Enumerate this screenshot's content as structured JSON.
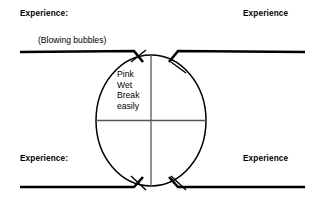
{
  "diagram": {
    "type": "venn-style-quadrant-circle",
    "labels": {
      "top_left": "Experience:",
      "top_right": "Experience",
      "bottom_left": "Experience:",
      "bottom_right": "Experience",
      "annotation_top_left": "(Blowing bubbles)"
    },
    "center_lines": [
      "Pink",
      "Wet",
      "Break",
      "easily"
    ],
    "colors": {
      "stroke": "#000000",
      "background": "#ffffff",
      "text": "#000000"
    },
    "geometry": {
      "circle_cx": 151,
      "circle_cy": 120.5,
      "circle_rx": 55,
      "circle_ry": 65.5,
      "top_rail_y": 52,
      "bottom_rail_y": 187,
      "vertical_divider_x": 151,
      "horizontal_divider_y": 120.5
    }
  }
}
